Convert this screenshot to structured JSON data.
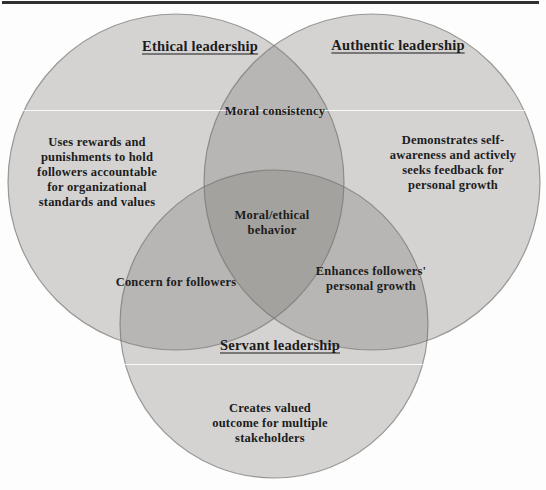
{
  "colors": {
    "background": "#fdfdfd",
    "circle_fill": "rgb(118,117,114)",
    "circle_fill_opacity": "0.3",
    "circle_stroke": "#6e6d68",
    "single_region_appearance": "#d6d5d3",
    "double_overlap_appearance": "#b5b4b1",
    "triple_overlap_appearance": "#a8a7a4",
    "top_rule": "#303030",
    "text": "#1c1c1c"
  },
  "diagram": {
    "type": "venn",
    "circles": [
      {
        "id": "ethical",
        "title": "Ethical leadership",
        "body": "Uses rewards and\npunishments to hold\nfollowers accountable\nfor organizational\nstandards and values"
      },
      {
        "id": "authentic",
        "title": "Authentic leadership",
        "body": "Demonstrates self-\nawareness and actively\nseeks feedback for\npersonal growth"
      },
      {
        "id": "servant",
        "title": "Servant leadership",
        "body": "Creates valued\noutcome for multiple\nstakeholders"
      }
    ],
    "overlaps": [
      {
        "id": "ethical-authentic",
        "label": "Moral consistency"
      },
      {
        "id": "ethical-authentic-servant",
        "label": "Moral/ethical\nbehavior"
      },
      {
        "id": "ethical-servant",
        "label": "Concern for followers"
      },
      {
        "id": "authentic-servant",
        "label": "Enhances followers'\npersonal growth"
      }
    ]
  }
}
